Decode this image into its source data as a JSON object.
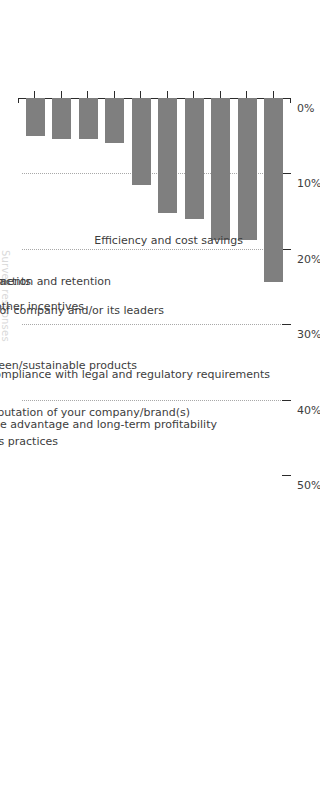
{
  "chart_data": {
    "type": "bar",
    "title": "",
    "subtitle": "",
    "xlabel": "",
    "ylabel": "",
    "orientation": "vertical-bars-rotated-90",
    "grid": true,
    "legend": null,
    "ylim": [
      0,
      50
    ],
    "tick_labels": [
      "0%",
      "10%",
      "20%",
      "30%",
      "40%",
      "50%"
    ],
    "tick_values": [
      0,
      10,
      20,
      30,
      40,
      50
    ],
    "gridline_values": [
      10,
      20,
      30,
      40
    ],
    "bar_color": "#7f7f7f",
    "axis_color": "#2b2b2b",
    "gridline_color": "#a8a8a8",
    "categories": [
      "Compliance with legal and regulatory requirements",
      "Efficiency and cost savings",
      "Achieving competitive advantage and long-term profitability",
      "Managing risk to the reputation of your company/brand(s)",
      "Value set of company and/or its leaders",
      "Customer demand for green/sustainable products",
      "Employee attraction and retention",
      "Government grants or other incentives",
      "Public scrutiny over labor, sourcing, or other business practices",
      "Supply chain vendor requirements"
    ],
    "values": [
      24.4,
      18.8,
      18.8,
      16.0,
      15.3,
      11.6,
      6.0,
      5.5,
      5.5,
      5.0
    ],
    "value_labels": [
      "24%",
      "19%",
      "19%",
      "16%",
      "15%",
      "12%",
      "6%",
      "5%",
      "5%",
      "5%"
    ]
  },
  "axis_title": {
    "text": "Survey responses"
  }
}
